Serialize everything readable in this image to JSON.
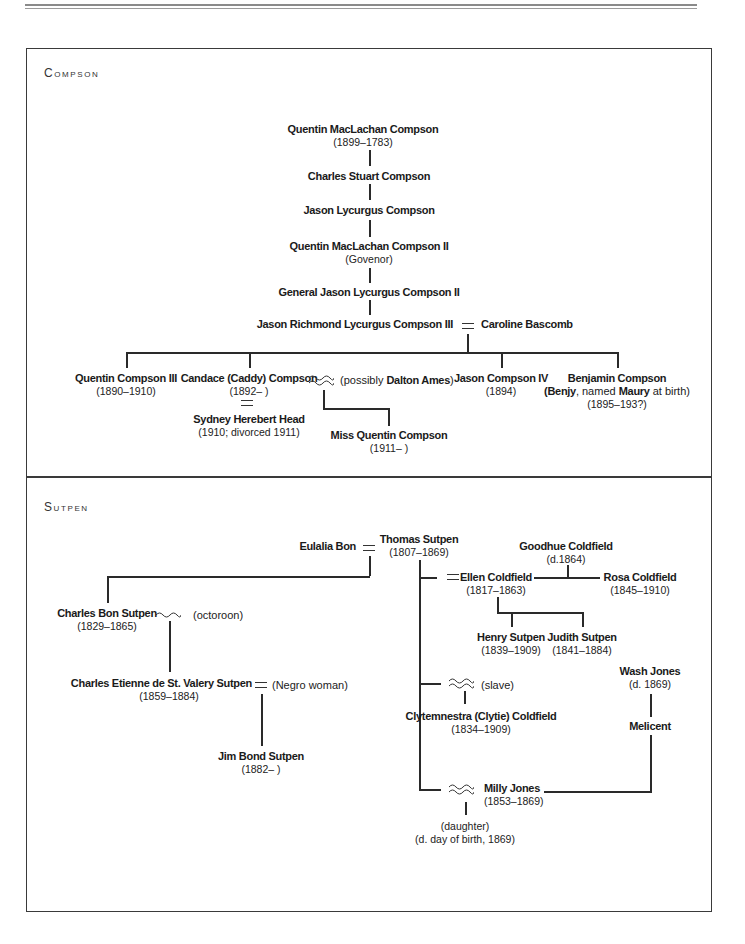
{
  "page": {
    "header_rule": true
  },
  "sections": {
    "compson": {
      "title": "Compson",
      "people": {
        "quentin_maclachan": {
          "name": "Quentin MacLachan Compson",
          "dates": "(1899–1783)"
        },
        "charles_stuart": {
          "name": "Charles Stuart Compson"
        },
        "jason_lycurgus": {
          "name": "Jason Lycurgus Compson"
        },
        "quentin_maclachan_ii": {
          "name": "Quentin MacLachan Compson II",
          "dates": "(Govenor)"
        },
        "general_jason": {
          "name": "General Jason Lycurgus Compson II"
        },
        "jason_richmond": {
          "name": "Jason Richmond Lycurgus Compson III"
        },
        "caroline": {
          "name": "Caroline Bascomb"
        },
        "quentin_iii": {
          "name": "Quentin Compson III",
          "dates": "(1890–1910)"
        },
        "candace": {
          "name": "Candace (Caddy) Compson",
          "dates": "(1892–      )"
        },
        "dalton": {
          "prefix": "(possibly ",
          "name": "Dalton Ames",
          "suffix": ")"
        },
        "sydney": {
          "name": "Sydney Herebert Head",
          "dates": "(1910; divorced 1911)"
        },
        "miss_quentin": {
          "name": "Miss Quentin Compson",
          "dates": "(1911–      )"
        },
        "jason_iv": {
          "name": "Jason Compson IV",
          "dates": "(1894)"
        },
        "benjamin": {
          "name": "Benjamin Compson",
          "alias_open": "(",
          "alias1": "Benjy",
          "alias_mid": ", named ",
          "alias2": "Maury",
          "alias_close": " at birth)",
          "dates": "(1895–193?)"
        }
      }
    },
    "sutpen": {
      "title": "Sutpen",
      "people": {
        "eulalia": {
          "name": "Eulalia Bon"
        },
        "thomas": {
          "name": "Thomas Sutpen",
          "dates": "(1807–1869)"
        },
        "goodhue": {
          "name": "Goodhue Coldfield",
          "dates": "(d.1864)"
        },
        "ellen": {
          "name": "Ellen Coldfield",
          "dates": "(1817–1863)"
        },
        "rosa": {
          "name": "Rosa Coldfield",
          "dates": "(1845–1910)"
        },
        "henry": {
          "name": "Henry Sutpen",
          "dates": "(1839–1909)"
        },
        "judith": {
          "name": "Judith Sutpen",
          "dates": "(1841–1884)"
        },
        "charles_bon": {
          "name": "Charles Bon Sutpen",
          "dates": "(1829–1865)"
        },
        "octoroon": {
          "label": "(octoroon)"
        },
        "charles_etienne": {
          "name": "Charles Etienne de St. Valery Sutpen",
          "dates": "(1859–1884)"
        },
        "negro_woman": {
          "label": "(Negro woman)"
        },
        "jim_bond": {
          "name": "Jim Bond Sutpen",
          "dates": "(1882–      )"
        },
        "slave": {
          "label": "(slave)"
        },
        "clytie": {
          "name": "Clytemnestra (Clytie) Coldfield",
          "dates": "(1834–1909)"
        },
        "wash": {
          "name": "Wash Jones",
          "dates": "(d. 1869)"
        },
        "melicent": {
          "name": "Melicent"
        },
        "milly": {
          "name": "Milly Jones",
          "dates": "(1853–1869)"
        },
        "daughter": {
          "label": "(daughter)",
          "dates": "(d. day of birth, 1869)"
        }
      }
    }
  },
  "legend": {
    "marriage_symbol": "=",
    "liaison_symbol": "≈"
  }
}
